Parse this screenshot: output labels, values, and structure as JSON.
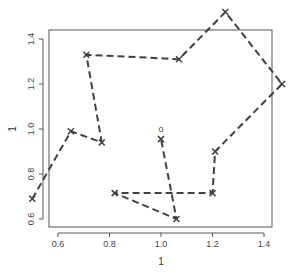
{
  "chart_data": {
    "type": "line",
    "title": "",
    "xlabel": "1",
    "ylabel": "1",
    "xlim": [
      0.57,
      1.44
    ],
    "ylim": [
      0.58,
      1.44
    ],
    "x_ticks": [
      0.6,
      0.8,
      1.0,
      1.2,
      1.4
    ],
    "x_tick_labels": [
      "0.6",
      "0.8",
      "1.0",
      "1.2",
      "1.4"
    ],
    "y_ticks": [
      0.6,
      0.8,
      1.0,
      1.2,
      1.4
    ],
    "y_tick_labels": [
      "0.6",
      "0.8",
      "1.0",
      "1.2",
      "1.4"
    ],
    "grid": false,
    "line_style": "dashed",
    "marker": "x",
    "series": [
      {
        "name": "path",
        "x": [
          0.5,
          0.65,
          0.77,
          0.71,
          1.07,
          1.25,
          1.47,
          1.21,
          1.2,
          0.82,
          1.06,
          1.0
        ],
        "y": [
          0.69,
          0.99,
          0.94,
          1.33,
          1.31,
          1.52,
          1.2,
          0.9,
          0.715,
          0.715,
          0.6,
          0.955
        ]
      }
    ],
    "annotations": [
      {
        "text": "o",
        "x": 1.0,
        "y": 1.0
      }
    ]
  },
  "colors": {
    "line": "#404040",
    "axis": "#555555",
    "text": "#444444"
  }
}
